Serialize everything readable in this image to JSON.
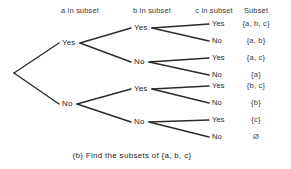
{
  "figure": {
    "caption": "(b) Find the subsets of {a, b, c}",
    "background_color": "#ffffff",
    "line_color": "#2b2b2b",
    "text_color": "#262626"
  },
  "headers": [
    {
      "label": "a in subset",
      "x": 80
    },
    {
      "label": "b in subset",
      "x": 152
    },
    {
      "label": "c in subset",
      "x": 214
    },
    {
      "label": "Subset",
      "x": 256
    }
  ],
  "tree": {
    "root": {
      "x": 13,
      "y": 73
    },
    "level1": [
      {
        "label": "Yes",
        "x": 62,
        "y": 43,
        "node_x": 79,
        "node_y": 43
      },
      {
        "label": "No",
        "x": 62,
        "y": 104,
        "node_x": 76,
        "node_y": 104
      }
    ],
    "level2": [
      {
        "label": "Yes",
        "x": 134,
        "y": 28,
        "node_x": 151,
        "node_y": 28
      },
      {
        "label": "No",
        "x": 134,
        "y": 62,
        "node_x": 148,
        "node_y": 62
      },
      {
        "label": "Yes",
        "x": 134,
        "y": 89,
        "node_x": 151,
        "node_y": 89
      },
      {
        "label": "No",
        "x": 134,
        "y": 122,
        "node_x": 148,
        "node_y": 122
      }
    ],
    "leaves": [
      {
        "label": "Yes",
        "x": 212,
        "y": 24
      },
      {
        "label": "No",
        "x": 212,
        "y": 41
      },
      {
        "label": "Yes",
        "x": 212,
        "y": 58
      },
      {
        "label": "No",
        "x": 212,
        "y": 75
      },
      {
        "label": "Yes",
        "x": 212,
        "y": 86
      },
      {
        "label": "No",
        "x": 212,
        "y": 103
      },
      {
        "label": "Yes",
        "x": 212,
        "y": 120
      },
      {
        "label": "No",
        "x": 212,
        "y": 137
      }
    ]
  },
  "subsets": [
    {
      "value": "{a, b, c}",
      "y": 24
    },
    {
      "value": "{a, b}",
      "y": 41
    },
    {
      "value": "{a, c}",
      "y": 58
    },
    {
      "value": "{a}",
      "y": 75
    },
    {
      "value": "{b, c}",
      "y": 86
    },
    {
      "value": "{b}",
      "y": 103
    },
    {
      "value": "{c}",
      "y": 120
    },
    {
      "value": "Ø",
      "y": 137
    }
  ],
  "edges": [
    {
      "x1": 14,
      "y1": 73,
      "x2": 59,
      "y2": 43
    },
    {
      "x1": 14,
      "y1": 73,
      "x2": 59,
      "y2": 104
    },
    {
      "x1": 80,
      "y1": 43,
      "x2": 131,
      "y2": 28
    },
    {
      "x1": 80,
      "y1": 43,
      "x2": 131,
      "y2": 62
    },
    {
      "x1": 77,
      "y1": 104,
      "x2": 131,
      "y2": 89
    },
    {
      "x1": 77,
      "y1": 104,
      "x2": 131,
      "y2": 122
    },
    {
      "x1": 152,
      "y1": 28,
      "x2": 209,
      "y2": 24
    },
    {
      "x1": 152,
      "y1": 28,
      "x2": 209,
      "y2": 41
    },
    {
      "x1": 149,
      "y1": 62,
      "x2": 209,
      "y2": 58
    },
    {
      "x1": 149,
      "y1": 62,
      "x2": 209,
      "y2": 75
    },
    {
      "x1": 152,
      "y1": 89,
      "x2": 209,
      "y2": 86
    },
    {
      "x1": 152,
      "y1": 89,
      "x2": 209,
      "y2": 103
    },
    {
      "x1": 149,
      "y1": 122,
      "x2": 209,
      "y2": 120
    },
    {
      "x1": 149,
      "y1": 122,
      "x2": 209,
      "y2": 137
    }
  ],
  "caption_position": {
    "x": 132,
    "y": 151
  }
}
